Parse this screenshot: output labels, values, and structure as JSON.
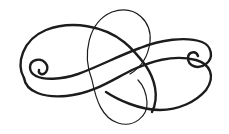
{
  "image": {
    "subject": "calligraphic-flourish-ornament",
    "background_color": "#ffffff",
    "ink_color": "#1c1c1c"
  }
}
